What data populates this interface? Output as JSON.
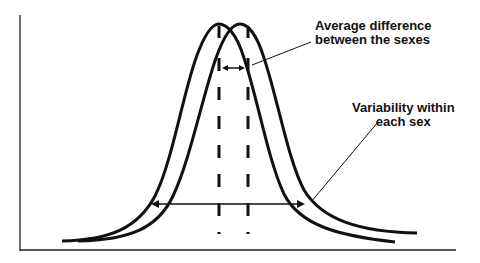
{
  "diagram": {
    "title": "",
    "labels": {
      "average_difference": {
        "line1": "Average difference",
        "line2": "between the sexes"
      },
      "variability": {
        "line1": "Variability within",
        "line2": "each sex"
      }
    },
    "curves": [
      {
        "name": "distribution-left",
        "peak_x": 219
      },
      {
        "name": "distribution-right",
        "peak_x": 240
      }
    ],
    "colors": {
      "line": "#111111",
      "background": "#ffffff"
    }
  }
}
